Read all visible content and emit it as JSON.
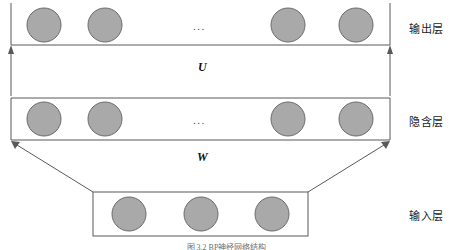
{
  "figure": {
    "width": 453,
    "height": 250,
    "background": "#ffffff",
    "caption": "图 3.2  BP神经网络结构"
  },
  "style": {
    "node_fill": "#a9a9a9",
    "node_stroke": "#6b6b6b",
    "line_color": "#595959",
    "text_color": "#1a1a1a"
  },
  "layers": [
    {
      "id": "output",
      "label": "输出层",
      "label_x": 409,
      "label_y": 20,
      "ellipsis": "...",
      "ellipsis_x": 193,
      "ellipsis_y": 20,
      "nodes": [
        {
          "cx": 44,
          "cy": 25,
          "r": 17
        },
        {
          "cx": 105,
          "cy": 25,
          "r": 17
        },
        {
          "cx": 288,
          "cy": 25,
          "r": 17
        },
        {
          "cx": 356,
          "cy": 25,
          "r": 17
        }
      ]
    },
    {
      "id": "hidden",
      "label": "隐含层",
      "label_x": 409,
      "label_y": 113,
      "ellipsis": "...",
      "ellipsis_x": 193,
      "ellipsis_y": 114,
      "nodes": [
        {
          "cx": 44,
          "cy": 119,
          "r": 17
        },
        {
          "cx": 105,
          "cy": 119,
          "r": 17
        },
        {
          "cx": 288,
          "cy": 119,
          "r": 17
        },
        {
          "cx": 356,
          "cy": 119,
          "r": 17
        }
      ]
    },
    {
      "id": "input",
      "label": "输入层",
      "label_x": 409,
      "label_y": 207,
      "ellipsis": "",
      "nodes": [
        {
          "cx": 129,
          "cy": 214,
          "r": 17
        },
        {
          "cx": 201,
          "cy": 214,
          "r": 17
        },
        {
          "cx": 272,
          "cy": 214,
          "r": 17
        }
      ]
    }
  ],
  "weights": [
    {
      "id": "U",
      "symbol": "U",
      "x": 198,
      "y": 60,
      "between": "hidden-to-output"
    },
    {
      "id": "W",
      "symbol": "W",
      "x": 197,
      "y": 150,
      "between": "input-to-hidden"
    }
  ],
  "boxes": {
    "output_band": {
      "left": 11,
      "right": 390,
      "top": 3,
      "bottom": 45
    },
    "hidden_band": {
      "left": 11,
      "right": 390,
      "top": 98,
      "bottom": 140
    },
    "input_band": {
      "left": 93,
      "right": 308,
      "top": 192,
      "bottom": 236
    },
    "upper_trapezoid": {
      "top_left": 11,
      "top_right": 390,
      "bottom_left": 11,
      "bottom_right": 390
    },
    "lower_trapezoid": {
      "top_left": 11,
      "top_right": 390,
      "bottom_left": 93,
      "bottom_right": 308
    }
  }
}
